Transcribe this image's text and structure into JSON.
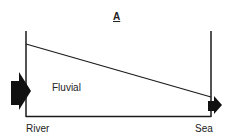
{
  "diagram": {
    "title": "A",
    "zone_label": "Fluvial",
    "left_label": "River",
    "right_label": "Sea",
    "colors": {
      "line": "#1a1a1a",
      "arrow": "#111111",
      "background": "#ffffff"
    }
  }
}
